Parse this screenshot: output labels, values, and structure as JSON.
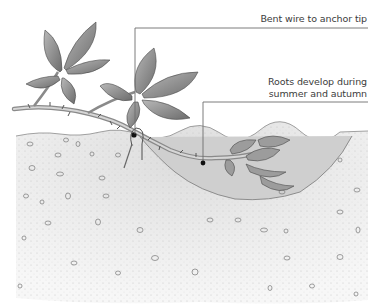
{
  "diagram": {
    "labels": [
      {
        "id": "wire",
        "text": "Bent wire to anchor tip"
      },
      {
        "id": "roots",
        "line1": "Roots develop during",
        "line2": "summer and autumn"
      }
    ],
    "colors": {
      "leader_line": "#6e6e6e",
      "soil_light": "#ebebeb",
      "soil_dark": "#c9c9c9",
      "leaf_fill": "#9a9a9a",
      "leaf_dark": "#5c5c5c",
      "stem": "#b5b5b5",
      "stone_stroke": "#777777"
    }
  }
}
